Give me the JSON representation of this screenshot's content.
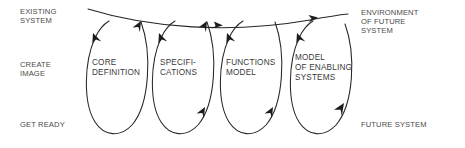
{
  "diagram": {
    "type": "spiral-loop-diagram",
    "background_color": "#ffffff",
    "stroke_color": "#262626",
    "text_color": "#3a3a3a",
    "left_labels": [
      {
        "id": "existing-system",
        "text": "EXISTING\nSYSTEM"
      },
      {
        "id": "create-image",
        "text": "CREATE\nIMAGE"
      },
      {
        "id": "get-ready",
        "text": "GET READY"
      }
    ],
    "right_labels": [
      {
        "id": "environment-of-future-system",
        "text": "ENVIRONMENT\nOF FUTURE\nSYSTEM"
      },
      {
        "id": "future-system",
        "text": "FUTURE SYSTEM"
      }
    ],
    "loops": [
      {
        "id": "core-definition",
        "text": "CORE\nDEFINITION"
      },
      {
        "id": "specifications",
        "text": "SPECIFI-\nCATIONS"
      },
      {
        "id": "functions-model",
        "text": "FUNCTIONS\nMODEL"
      },
      {
        "id": "model-of-enabling-systems",
        "text": "MODEL\nOF ENABLING\nSYSTEMS"
      }
    ]
  }
}
